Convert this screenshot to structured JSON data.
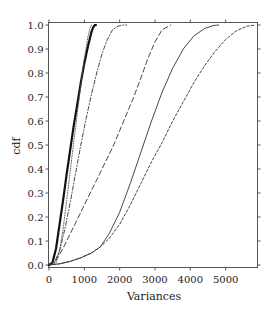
{
  "chart_data": {
    "type": "line",
    "title": "",
    "xlabel": "Variances",
    "ylabel": "cdf",
    "xlim": [
      0,
      5900
    ],
    "ylim": [
      0.0,
      1.0
    ],
    "grid": false,
    "legend": null,
    "x_ticks": [
      0,
      1000,
      2000,
      3000,
      4000,
      5000
    ],
    "x_tick_labels": [
      "0",
      "1000",
      "2000",
      "3000",
      "4000",
      "5000"
    ],
    "y_ticks": [
      0.0,
      0.1,
      0.2,
      0.3,
      0.4,
      0.5,
      0.6,
      0.7,
      0.8,
      0.9,
      1.0
    ],
    "y_tick_labels": [
      "0.0",
      "0.1",
      "0.2",
      "0.3",
      "0.4",
      "0.5",
      "0.6",
      "0.7",
      "0.8",
      "0.9",
      "1.0"
    ],
    "series": [
      {
        "name": "thick-solid",
        "style": "solid",
        "width": 2.2,
        "color": "#111111",
        "x": [
          0,
          100,
          200,
          300,
          400,
          500,
          600,
          700,
          800,
          900,
          1000,
          1100,
          1200,
          1250,
          1300,
          1330
        ],
        "y": [
          0.0,
          0.01,
          0.07,
          0.17,
          0.27,
          0.38,
          0.48,
          0.58,
          0.67,
          0.76,
          0.84,
          0.91,
          0.97,
          0.99,
          1.0,
          1.0
        ]
      },
      {
        "name": "dotted",
        "style": "dotted",
        "width": 0.9,
        "color": "#555555",
        "x": [
          0,
          200,
          300,
          400,
          500,
          600,
          700,
          800,
          900,
          1000,
          1100,
          1150,
          1200
        ],
        "y": [
          0.0,
          0.01,
          0.06,
          0.15,
          0.27,
          0.39,
          0.51,
          0.63,
          0.75,
          0.86,
          0.95,
          0.98,
          1.0
        ]
      },
      {
        "name": "dash-dot",
        "style": "dashdot",
        "width": 0.9,
        "color": "#333333",
        "x": [
          0,
          150,
          300,
          450,
          600,
          750,
          900,
          1050,
          1200,
          1350,
          1500,
          1650,
          1800,
          1950,
          2100,
          2200
        ],
        "y": [
          0.0,
          0.01,
          0.06,
          0.15,
          0.26,
          0.38,
          0.5,
          0.61,
          0.71,
          0.8,
          0.88,
          0.94,
          0.98,
          0.995,
          1.0,
          1.0
        ]
      },
      {
        "name": "long-dashed",
        "style": "dashed",
        "width": 0.9,
        "color": "#333333",
        "x": [
          0,
          200,
          400,
          600,
          800,
          1000,
          1200,
          1400,
          1600,
          1800,
          2000,
          2200,
          2400,
          2600,
          2800,
          3000,
          3200,
          3450
        ],
        "y": [
          0.0,
          0.02,
          0.07,
          0.13,
          0.19,
          0.25,
          0.31,
          0.37,
          0.43,
          0.49,
          0.56,
          0.63,
          0.7,
          0.78,
          0.86,
          0.93,
          0.98,
          1.0
        ]
      },
      {
        "name": "thin-solid",
        "style": "solid",
        "width": 0.9,
        "color": "#333333",
        "x": [
          0,
          300,
          600,
          900,
          1200,
          1450,
          1700,
          2000,
          2300,
          2600,
          2900,
          3200,
          3500,
          3800,
          4100,
          4400,
          4650,
          4800
        ],
        "y": [
          0.0,
          0.005,
          0.015,
          0.03,
          0.05,
          0.075,
          0.13,
          0.22,
          0.34,
          0.47,
          0.6,
          0.72,
          0.82,
          0.9,
          0.955,
          0.985,
          0.998,
          1.0
        ]
      },
      {
        "name": "short-dashed",
        "style": "shortdash",
        "width": 0.9,
        "color": "#333333",
        "x": [
          0,
          300,
          600,
          900,
          1200,
          1450,
          1700,
          2000,
          2300,
          2600,
          2900,
          3200,
          3500,
          3800,
          4100,
          4400,
          4700,
          5000,
          5300,
          5600,
          5850
        ],
        "y": [
          0.0,
          0.005,
          0.015,
          0.03,
          0.05,
          0.075,
          0.11,
          0.17,
          0.25,
          0.34,
          0.43,
          0.51,
          0.6,
          0.68,
          0.76,
          0.83,
          0.89,
          0.94,
          0.975,
          0.995,
          1.0
        ]
      }
    ]
  }
}
